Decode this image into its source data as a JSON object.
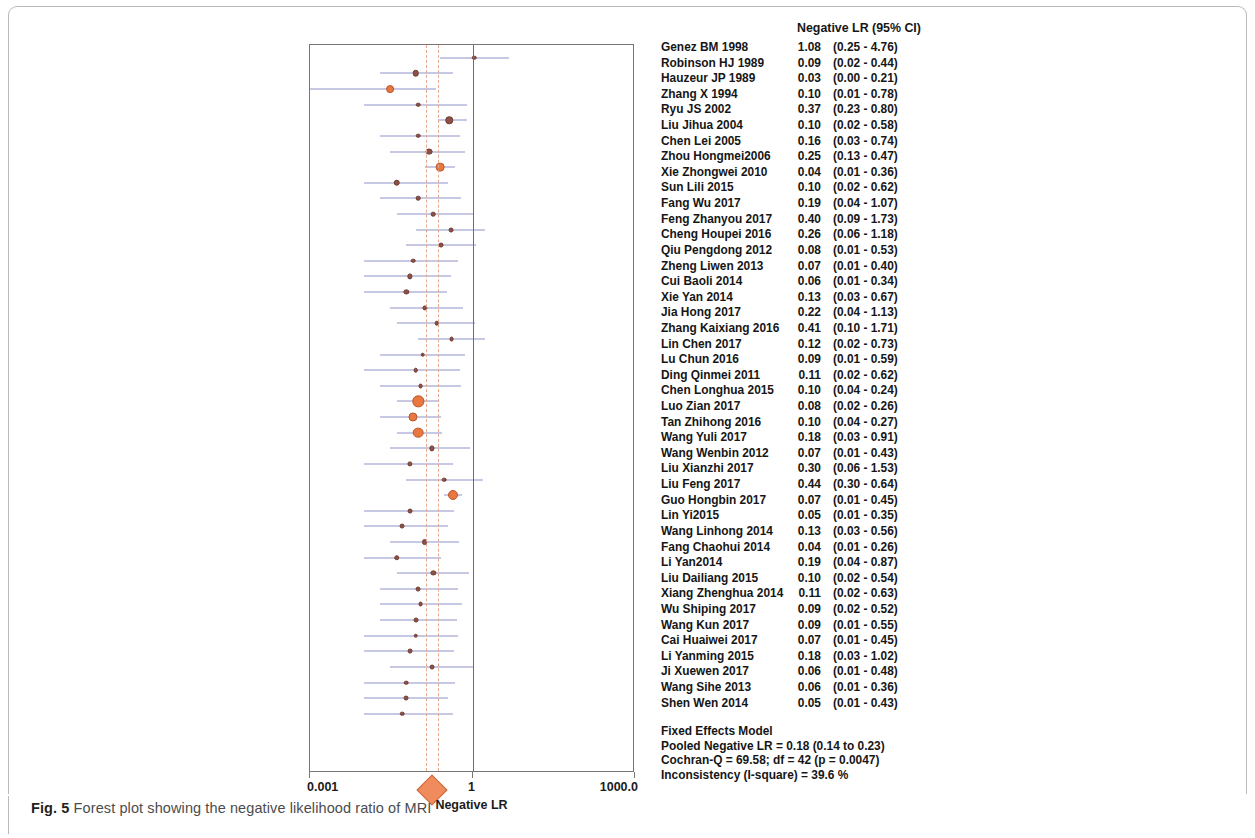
{
  "caption": {
    "figure_label": "Fig. 5",
    "text": " Forest plot showing the negative likelihood ratio of MRI"
  },
  "table": {
    "header": "Negative LR (95% CI)"
  },
  "axis": {
    "title": "Negative LR",
    "ticks": [
      "0.001",
      "1",
      "1000.0"
    ],
    "tick_values": [
      0.001,
      1,
      1000.0
    ]
  },
  "summary": {
    "model": "Fixed Effects Model",
    "pooled": "Pooled Negative LR = 0.18 (0.14 to 0.23)",
    "cochran": "Cochran-Q = 69.58; df =  42 (p = 0.0047)",
    "inconsistency": "Inconsistency (I-square) = 39.6 %"
  },
  "colors": {
    "marker_small": "#8d5245",
    "marker_large": "#e8783f",
    "ci_line": "#8f92c8",
    "refline": "#e7a98e",
    "diamond": "#ef8b5c",
    "axis": "#767676"
  },
  "chart_data": {
    "type": "forest",
    "title": "Negative LR (95% CI)",
    "xlabel": "Negative LR",
    "ylabel": "",
    "xscale": "log",
    "xlim": [
      0.001,
      1000.0
    ],
    "xticks": [
      0.001,
      1,
      1000.0
    ],
    "grid": false,
    "reference_lines": [
      0.14,
      0.23
    ],
    "null_line": 1,
    "pooled": {
      "label": "Fixed Effects Model",
      "estimate": 0.18,
      "ci_low": 0.14,
      "ci_high": 0.23,
      "cochran_q": 69.58,
      "df": 42,
      "p": 0.0047,
      "i_square_percent": 39.6
    },
    "columns": [
      "Study",
      "Negative LR",
      "95% CI"
    ],
    "studies": [
      {
        "label": "Genez BM 1998",
        "estimate": 1.08,
        "ci_low": 0.25,
        "ci_high": 4.76,
        "est_text": "1.08",
        "ci_text": "(0.25 - 4.76)",
        "weight": 1.0
      },
      {
        "label": "Robinson HJ 1989",
        "estimate": 0.09,
        "ci_low": 0.02,
        "ci_high": 0.44,
        "est_text": "0.09",
        "ci_text": "(0.02 - 0.44)",
        "weight": 1.6
      },
      {
        "label": "Hauzeur JP 1989",
        "estimate": 0.03,
        "ci_low": 0.0,
        "ci_high": 0.21,
        "est_text": "0.03",
        "ci_text": "(0.00 - 0.21)",
        "weight": 2.0
      },
      {
        "label": "Zhang X 1994",
        "estimate": 0.1,
        "ci_low": 0.01,
        "ci_high": 0.78,
        "est_text": "0.10",
        "ci_text": "(0.01 - 0.78)",
        "weight": 1.0
      },
      {
        "label": "Ryu JS 2002",
        "estimate": 0.37,
        "ci_low": 0.23,
        "ci_high": 0.8,
        "est_text": "0.37",
        "ci_text": "(0.23 - 0.80)",
        "weight": 1.9
      },
      {
        "label": "Liu Jihua 2004",
        "estimate": 0.1,
        "ci_low": 0.02,
        "ci_high": 0.58,
        "est_text": "0.10",
        "ci_text": "(0.02 - 0.58)",
        "weight": 1.0
      },
      {
        "label": "Chen Lei 2005",
        "estimate": 0.16,
        "ci_low": 0.03,
        "ci_high": 0.74,
        "est_text": "0.16",
        "ci_text": "(0.03 - 0.74)",
        "weight": 1.7
      },
      {
        "label": "Zhou Hongmei2006",
        "estimate": 0.25,
        "ci_low": 0.13,
        "ci_high": 0.47,
        "est_text": "0.25",
        "ci_text": "(0.13 - 0.47)",
        "weight": 2.3
      },
      {
        "label": "Xie Zhongwei 2010",
        "estimate": 0.04,
        "ci_low": 0.01,
        "ci_high": 0.36,
        "est_text": "0.04",
        "ci_text": "(0.01 - 0.36)",
        "weight": 1.6
      },
      {
        "label": "Sun Lili 2015",
        "estimate": 0.1,
        "ci_low": 0.02,
        "ci_high": 0.62,
        "est_text": "0.10",
        "ci_text": "(0.02 - 0.62)",
        "weight": 1.0
      },
      {
        "label": "Fang Wu 2017",
        "estimate": 0.19,
        "ci_low": 0.04,
        "ci_high": 1.07,
        "est_text": "0.19",
        "ci_text": "(0.04 - 1.07)",
        "weight": 1.0
      },
      {
        "label": "Feng Zhanyou 2017",
        "estimate": 0.4,
        "ci_low": 0.09,
        "ci_high": 1.73,
        "est_text": "0.40",
        "ci_text": "(0.09 - 1.73)",
        "weight": 1.1
      },
      {
        "label": "Cheng Houpei 2016",
        "estimate": 0.26,
        "ci_low": 0.06,
        "ci_high": 1.18,
        "est_text": "0.26",
        "ci_text": "(0.06 - 1.18)",
        "weight": 1.1
      },
      {
        "label": "Qiu Pengdong 2012",
        "estimate": 0.08,
        "ci_low": 0.01,
        "ci_high": 0.53,
        "est_text": "0.08",
        "ci_text": "(0.01 - 0.53)",
        "weight": 1.0
      },
      {
        "label": "Zheng Liwen 2013",
        "estimate": 0.07,
        "ci_low": 0.01,
        "ci_high": 0.4,
        "est_text": "0.07",
        "ci_text": "(0.01 - 0.40)",
        "weight": 1.2
      },
      {
        "label": "Cui Baoli 2014",
        "estimate": 0.06,
        "ci_low": 0.01,
        "ci_high": 0.34,
        "est_text": "0.06",
        "ci_text": "(0.01 - 0.34)",
        "weight": 1.2
      },
      {
        "label": "Xie Yan 2014",
        "estimate": 0.13,
        "ci_low": 0.03,
        "ci_high": 0.67,
        "est_text": "0.13",
        "ci_text": "(0.03 - 0.67)",
        "weight": 1.2
      },
      {
        "label": "Jia Hong 2017",
        "estimate": 0.22,
        "ci_low": 0.04,
        "ci_high": 1.13,
        "est_text": "0.22",
        "ci_text": "(0.04 - 1.13)",
        "weight": 1.0
      },
      {
        "label": "Zhang Kaixiang 2016",
        "estimate": 0.41,
        "ci_low": 0.1,
        "ci_high": 1.71,
        "est_text": "0.41",
        "ci_text": "(0.10 - 1.71)",
        "weight": 1.1
      },
      {
        "label": "Lin Chen 2017",
        "estimate": 0.12,
        "ci_low": 0.02,
        "ci_high": 0.73,
        "est_text": "0.12",
        "ci_text": "(0.02 - 0.73)",
        "weight": 1.0
      },
      {
        "label": "Lu Chun 2016",
        "estimate": 0.09,
        "ci_low": 0.01,
        "ci_high": 0.59,
        "est_text": "0.09",
        "ci_text": "(0.01 - 0.59)",
        "weight": 1.0
      },
      {
        "label": "Ding Qinmei 2011",
        "estimate": 0.11,
        "ci_low": 0.02,
        "ci_high": 0.62,
        "est_text": "0.11",
        "ci_text": "(0.02 - 0.62)",
        "weight": 1.1
      },
      {
        "label": "Chen Longhua 2015",
        "estimate": 0.1,
        "ci_low": 0.04,
        "ci_high": 0.24,
        "est_text": "0.10",
        "ci_text": "(0.04 - 0.24)",
        "weight": 3.1
      },
      {
        "label": "Luo Zian 2017",
        "estimate": 0.08,
        "ci_low": 0.02,
        "ci_high": 0.26,
        "est_text": "0.08",
        "ci_text": "(0.02 - 0.26)",
        "weight": 2.4
      },
      {
        "label": "Tan Zhihong 2016",
        "estimate": 0.1,
        "ci_low": 0.04,
        "ci_high": 0.27,
        "est_text": "0.10",
        "ci_text": "(0.04 - 0.27)",
        "weight": 2.9
      },
      {
        "label": "Wang Yuli 2017",
        "estimate": 0.18,
        "ci_low": 0.03,
        "ci_high": 0.91,
        "est_text": "0.18",
        "ci_text": "(0.03 - 0.91)",
        "weight": 1.2
      },
      {
        "label": "Wang Wenbin 2012",
        "estimate": 0.07,
        "ci_low": 0.01,
        "ci_high": 0.43,
        "est_text": "0.07",
        "ci_text": "(0.01 - 0.43)",
        "weight": 1.2
      },
      {
        "label": "Liu Xianzhi 2017",
        "estimate": 0.3,
        "ci_low": 0.06,
        "ci_high": 1.53,
        "est_text": "0.30",
        "ci_text": "(0.06 - 1.53)",
        "weight": 1.0
      },
      {
        "label": "Liu Feng 2017",
        "estimate": 0.44,
        "ci_low": 0.3,
        "ci_high": 0.64,
        "est_text": "0.44",
        "ci_text": "(0.30 - 0.64)",
        "weight": 2.7
      },
      {
        "label": "Guo Hongbin 2017",
        "estimate": 0.07,
        "ci_low": 0.01,
        "ci_high": 0.45,
        "est_text": "0.07",
        "ci_text": "(0.01 - 0.45)",
        "weight": 1.1
      },
      {
        "label": "Lin Yi2015",
        "estimate": 0.05,
        "ci_low": 0.01,
        "ci_high": 0.35,
        "est_text": "0.05",
        "ci_text": "(0.01 - 0.35)",
        "weight": 1.1
      },
      {
        "label": "Wang Linhong 2014",
        "estimate": 0.13,
        "ci_low": 0.03,
        "ci_high": 0.56,
        "est_text": "0.13",
        "ci_text": "(0.03 - 0.56)",
        "weight": 1.4
      },
      {
        "label": "Fang Chaohui 2014",
        "estimate": 0.04,
        "ci_low": 0.01,
        "ci_high": 0.26,
        "est_text": "0.04",
        "ci_text": "(0.01 - 0.26)",
        "weight": 1.3
      },
      {
        "label": "Li Yan2014",
        "estimate": 0.19,
        "ci_low": 0.04,
        "ci_high": 0.87,
        "est_text": "0.19",
        "ci_text": "(0.04 - 0.87)",
        "weight": 1.2
      },
      {
        "label": "Liu Dailiang 2015",
        "estimate": 0.1,
        "ci_low": 0.02,
        "ci_high": 0.54,
        "est_text": "0.10",
        "ci_text": "(0.02 - 0.54)",
        "weight": 1.1
      },
      {
        "label": "Xiang Zhenghua 2014",
        "estimate": 0.11,
        "ci_low": 0.02,
        "ci_high": 0.63,
        "est_text": "0.11",
        "ci_text": "(0.02 - 0.63)",
        "weight": 1.1
      },
      {
        "label": "Wu Shiping 2017",
        "estimate": 0.09,
        "ci_low": 0.02,
        "ci_high": 0.52,
        "est_text": "0.09",
        "ci_text": "(0.02 - 0.52)",
        "weight": 1.1
      },
      {
        "label": "Wang Kun 2017",
        "estimate": 0.09,
        "ci_low": 0.01,
        "ci_high": 0.55,
        "est_text": "0.09",
        "ci_text": "(0.01 - 0.55)",
        "weight": 1.0
      },
      {
        "label": "Cai Huaiwei 2017",
        "estimate": 0.07,
        "ci_low": 0.01,
        "ci_high": 0.45,
        "est_text": "0.07",
        "ci_text": "(0.01 - 0.45)",
        "weight": 1.1
      },
      {
        "label": "Li Yanming 2015",
        "estimate": 0.18,
        "ci_low": 0.03,
        "ci_high": 1.02,
        "est_text": "0.18",
        "ci_text": "(0.03 - 1.02)",
        "weight": 1.1
      },
      {
        "label": "Ji Xuewen 2017",
        "estimate": 0.06,
        "ci_low": 0.01,
        "ci_high": 0.48,
        "est_text": "0.06",
        "ci_text": "(0.01 - 0.48)",
        "weight": 1.0
      },
      {
        "label": "Wang Sihe 2013",
        "estimate": 0.06,
        "ci_low": 0.01,
        "ci_high": 0.36,
        "est_text": "0.06",
        "ci_text": "(0.01 - 0.36)",
        "weight": 1.1
      },
      {
        "label": "Shen Wen 2014",
        "estimate": 0.05,
        "ci_low": 0.01,
        "ci_high": 0.43,
        "est_text": "0.05",
        "ci_text": "(0.01 - 0.43)",
        "weight": 1.0
      }
    ]
  }
}
